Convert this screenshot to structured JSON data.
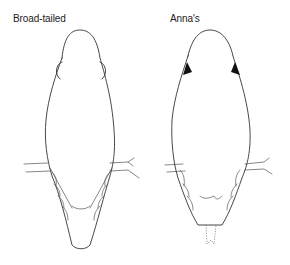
{
  "figure": {
    "panels": [
      {
        "id": "left",
        "label": "Broad-tailed",
        "view": "dorsal",
        "tail": "long-rounded",
        "shoulder_marks": "outline"
      },
      {
        "id": "right",
        "label": "Anna's",
        "view": "dorsal",
        "tail": "short-notched",
        "shoulder_marks": "filled-black"
      }
    ],
    "colors": {
      "background": "#ffffff",
      "line": "#333333",
      "text": "#222222"
    }
  }
}
